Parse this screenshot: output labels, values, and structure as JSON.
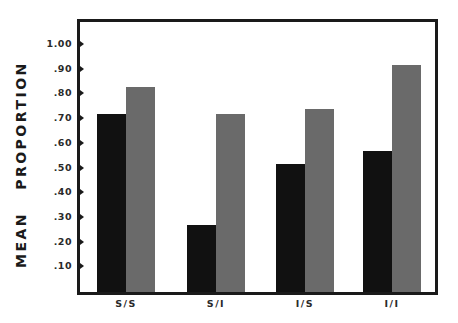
{
  "chart_data": {
    "type": "bar",
    "title": "",
    "xlabel": "",
    "ylabel": "MEAN   PROPORTION",
    "categories": [
      "S/S",
      "S/I",
      "I/S",
      "I/I"
    ],
    "series": [
      {
        "name": "dark",
        "values": [
          0.72,
          0.27,
          0.52,
          0.57
        ]
      },
      {
        "name": "light",
        "values": [
          0.83,
          0.72,
          0.74,
          0.92
        ]
      }
    ],
    "ylim": [
      0,
      1.0
    ],
    "yticks": [
      ".10",
      ".20",
      ".30",
      ".40",
      ".50",
      ".60",
      ".70",
      ".80",
      ".90",
      "1.00"
    ],
    "grid": false,
    "legend": "none"
  }
}
